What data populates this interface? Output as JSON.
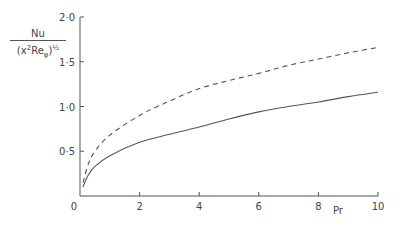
{
  "chart_data": {
    "type": "line",
    "title": "",
    "xlabel": "Pr",
    "ylabel": "Nu / (x^2 Re_phi)^(1/2)",
    "ylabel_parts": {
      "numerator": "Nu",
      "denominator_open": "(x",
      "denominator_sup": "2",
      "denominator_re": "Re",
      "denominator_sub": "φ",
      "denominator_close": ")",
      "exponent": "½"
    },
    "xlim": [
      0,
      10
    ],
    "ylim": [
      0,
      2.0
    ],
    "xticks": [
      0,
      2,
      4,
      6,
      8,
      10
    ],
    "xtick_labels": [
      "0",
      "2",
      "4",
      "6",
      "8",
      "10"
    ],
    "yticks": [
      0.5,
      1.0,
      1.5,
      2.0
    ],
    "ytick_labels": [
      "0·5",
      "1·0",
      "1·5",
      "2·0"
    ],
    "grid": false,
    "legend": null,
    "series": [
      {
        "name": "dashed",
        "style": "dashed",
        "x": [
          0.1,
          0.27,
          0.5,
          1,
          2,
          3,
          4,
          5,
          6,
          7,
          8,
          9,
          10
        ],
        "y": [
          0.15,
          0.35,
          0.5,
          0.68,
          0.9,
          1.06,
          1.2,
          1.29,
          1.37,
          1.46,
          1.53,
          1.6,
          1.66
        ]
      },
      {
        "name": "solid",
        "style": "solid",
        "x": [
          0.1,
          0.27,
          0.5,
          1,
          2,
          3,
          4,
          5,
          6,
          7,
          8,
          9,
          10
        ],
        "y": [
          0.1,
          0.23,
          0.33,
          0.45,
          0.6,
          0.69,
          0.77,
          0.86,
          0.94,
          1.0,
          1.05,
          1.11,
          1.16
        ]
      }
    ]
  },
  "axes": {
    "origin_label": "0",
    "x_label": "Pr"
  }
}
